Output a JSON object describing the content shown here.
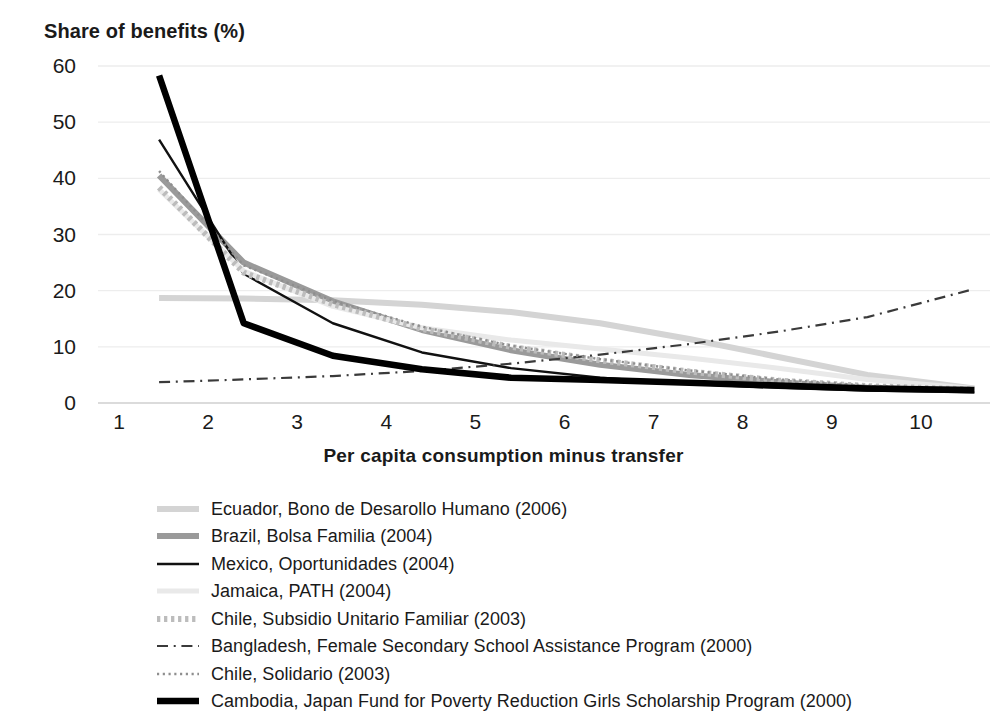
{
  "chart_data": {
    "type": "line",
    "title": "",
    "ylabel": "Share of benefits (%)",
    "xlabel": "Per capita consumption minus transfer",
    "categories": [
      1,
      2,
      3,
      4,
      5,
      6,
      7,
      8,
      9,
      10
    ],
    "xlim": [
      0.6,
      10.8
    ],
    "ylim": [
      0,
      62
    ],
    "yticks": [
      0,
      10,
      20,
      30,
      40,
      50,
      60
    ],
    "xticks": [
      1,
      2,
      3,
      4,
      5,
      6,
      7,
      8,
      9,
      10
    ],
    "grid": "horizontal-faint",
    "legend_position": "below-plot-left",
    "series": [
      {
        "name": "Ecuador, Bono de Desarollo Humano (2006)",
        "style": "solid",
        "color": "#d4d4d4",
        "width": 6,
        "x": [
          1.45,
          2.4,
          3.4,
          4.4,
          5.4,
          6.4,
          7.4,
          8.4,
          9.4,
          10.6
        ],
        "values": [
          18.7,
          18.6,
          18.3,
          17.5,
          16.2,
          14.2,
          11.4,
          8.2,
          5.0,
          2.6
        ]
      },
      {
        "name": "Brazil, Bolsa Familia (2004)",
        "style": "solid",
        "color": "#9a9a9a",
        "width": 6,
        "x": [
          1.45,
          2.4,
          3.4,
          4.4,
          5.4,
          6.4,
          7.4,
          8.4,
          9.4,
          10.6
        ],
        "values": [
          40.5,
          25.0,
          18.1,
          13.0,
          9.4,
          6.8,
          5.0,
          3.7,
          2.7,
          2.2
        ]
      },
      {
        "name": "Mexico, Oportunidades (2004)",
        "style": "solid",
        "color": "#111111",
        "width": 2.4,
        "x": [
          1.45,
          2.4,
          3.4,
          4.4,
          5.4,
          6.4,
          7.4,
          8.4,
          9.4,
          10.6
        ],
        "values": [
          46.9,
          23.0,
          14.2,
          9.0,
          6.2,
          4.5,
          3.4,
          2.7,
          2.2,
          1.9
        ]
      },
      {
        "name": "Jamaica, PATH (2004)",
        "style": "solid",
        "color": "#e9e9e9",
        "width": 5,
        "x": [
          1.45,
          2.4,
          3.4,
          4.4,
          5.4,
          6.4,
          7.4,
          8.4,
          9.4,
          10.6
        ],
        "values": [
          38.0,
          23.5,
          17.2,
          13.4,
          11.2,
          9.6,
          8.0,
          6.2,
          4.2,
          2.6
        ]
      },
      {
        "name": "Chile, Subsidio Unitario Familiar (2003)",
        "style": "dotted-thick",
        "color": "#bcbcbc",
        "width": 6,
        "x": [
          1.45,
          2.4,
          3.4,
          4.4,
          5.4,
          6.4,
          7.4,
          8.4,
          9.4,
          10.6
        ],
        "values": [
          38.4,
          23.2,
          17.6,
          13.2,
          10.0,
          7.6,
          5.6,
          4.0,
          3.0,
          2.4
        ]
      },
      {
        "name": "Bangladesh, Female Secondary School Assistance Program (2000)",
        "style": "dash-dot",
        "color": "#3a3a3a",
        "width": 2.2,
        "x": [
          1.45,
          2.4,
          3.4,
          4.4,
          5.4,
          6.4,
          7.4,
          8.4,
          9.4,
          10.6
        ],
        "values": [
          3.7,
          4.2,
          4.8,
          5.7,
          7.0,
          8.6,
          10.5,
          12.7,
          15.3,
          20.3
        ]
      },
      {
        "name": "Chile, Solidario (2003)",
        "style": "dotted-fine",
        "color": "#8e8e8e",
        "width": 2.4,
        "x": [
          1.45,
          2.4,
          3.4,
          4.4,
          5.4,
          6.4,
          7.4,
          8.4,
          9.4,
          10.6
        ],
        "values": [
          41.3,
          24.5,
          18.2,
          13.6,
          10.2,
          7.8,
          5.8,
          4.2,
          3.1,
          2.4
        ]
      },
      {
        "name": "Cambodia, Japan Fund for Poverty Reduction Girls Scholarship Program (2000)",
        "style": "solid",
        "color": "#000000",
        "width": 6.5,
        "x": [
          1.45,
          2.4,
          3.4,
          4.4,
          5.4,
          6.4,
          7.4,
          8.4,
          9.4,
          10.6
        ],
        "values": [
          58.3,
          14.2,
          8.4,
          6.0,
          4.5,
          4.1,
          3.6,
          3.1,
          2.6,
          2.3
        ]
      }
    ]
  },
  "axis": {
    "y_title": "Share of benefits (%)",
    "x_title": "Per capita consumption minus transfer",
    "y_ticks": [
      "60",
      "50",
      "40",
      "30",
      "20",
      "10",
      "0"
    ],
    "x_ticks": [
      "1",
      "2",
      "3",
      "4",
      "5",
      "6",
      "7",
      "8",
      "9",
      "10"
    ]
  },
  "legend": {
    "items": [
      {
        "label": "Ecuador, Bono de Desarollo Humano (2006)",
        "key": "line-key-light-gray-solid"
      },
      {
        "label": "Brazil, Bolsa Familia (2004)",
        "key": "line-key-gray-solid"
      },
      {
        "label": "Mexico, Oportunidades (2004)",
        "key": "line-key-black-thin-solid"
      },
      {
        "label": "Jamaica, PATH (2004)",
        "key": "line-key-very-light-gray-solid"
      },
      {
        "label": "Chile, Subsidio Unitario Familiar (2003)",
        "key": "line-key-gray-dotted-thick"
      },
      {
        "label": "Bangladesh, Female Secondary School Assistance Program (2000)",
        "key": "line-key-dash-dot"
      },
      {
        "label": "Chile, Solidario (2003)",
        "key": "line-key-gray-dotted-fine"
      },
      {
        "label": "Cambodia, Japan Fund for Poverty Reduction Girls Scholarship Program (2000)",
        "key": "line-key-black-thick-solid"
      }
    ]
  }
}
